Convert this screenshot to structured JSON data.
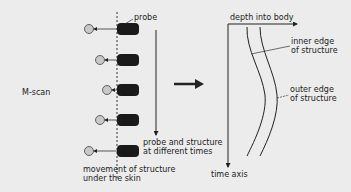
{
  "labels": {
    "scan_type": "M-scan",
    "probe": "probe",
    "probe_times_line1": "probe and structure",
    "probe_times_line2": "at different times",
    "movement_line1": "movement of structure",
    "movement_line2": "under the skin",
    "depth_axis": "depth into body",
    "time_axis": "time axis",
    "inner_edge_line1": "inner edge",
    "inner_edge_line2": "of structure",
    "outer_edge_line1": "outer edge",
    "outer_edge_line2": "of structure"
  },
  "colors": {
    "background": "#ececec",
    "probe": "#1a1a1a",
    "structure_circle": "#c8c8c8",
    "line": "#222222"
  },
  "probes": [
    {
      "index": 1,
      "structure_offset": "far"
    },
    {
      "index": 2,
      "structure_offset": "mid"
    },
    {
      "index": 3,
      "structure_offset": "near"
    },
    {
      "index": 4,
      "structure_offset": "mid"
    },
    {
      "index": 5,
      "structure_offset": "far"
    }
  ]
}
